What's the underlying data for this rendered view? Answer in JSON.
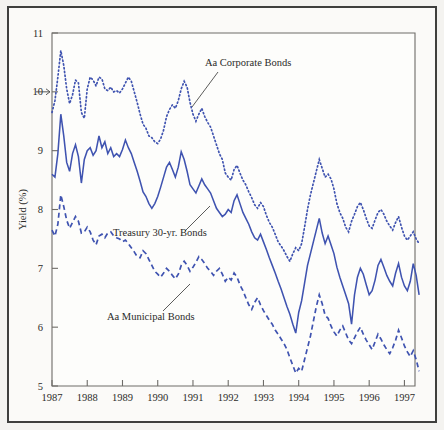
{
  "figure": {
    "background": "#f4f3f0",
    "panel_background": "#fbfaf8",
    "frame_color": "#3f3f3d",
    "series_color": "#3f53b0",
    "axis_color": "#6e6c68"
  },
  "axes": {
    "ylabel": "Yield (%)",
    "yticks": [
      "5",
      "6",
      "7",
      "8",
      "9",
      "10",
      "11"
    ],
    "xticks": [
      "1987",
      "1988",
      "1989",
      "1990",
      "1991",
      "1992",
      "1993",
      "1994",
      "1995",
      "1996",
      "1997"
    ]
  },
  "annotations": [
    {
      "id": "corporate",
      "label": "Aa Corporate Bonds"
    },
    {
      "id": "treasury",
      "label": "Treasury 30-yr. Bonds"
    },
    {
      "id": "municipal",
      "label": "Aa Municipal Bonds"
    }
  ],
  "chart_data": {
    "type": "line",
    "title": "",
    "xlabel": "",
    "ylabel": "Yield (%)",
    "xlim": [
      1987,
      1997.3
    ],
    "ylim": [
      5,
      11
    ],
    "grid": false,
    "legend": "inline-annotations",
    "xticks": [
      1987,
      1988,
      1989,
      1990,
      1991,
      1992,
      1993,
      1994,
      1995,
      1996,
      1997
    ],
    "yticks": [
      5,
      6,
      7,
      8,
      9,
      10,
      11
    ],
    "x_start": 1987.0,
    "x_step": 0.0833333,
    "series": [
      {
        "name": "Aa Corporate Bonds",
        "style": "dotted",
        "values": [
          9.65,
          9.85,
          10.25,
          10.7,
          10.45,
          10.05,
          9.8,
          9.95,
          10.2,
          10.15,
          9.65,
          9.55,
          10.05,
          10.25,
          10.2,
          10.1,
          10.25,
          10.22,
          10.05,
          10.02,
          10.08,
          10.0,
          10.02,
          9.98,
          10.05,
          10.15,
          10.25,
          10.18,
          10.0,
          9.82,
          9.62,
          9.45,
          9.38,
          9.25,
          9.22,
          9.15,
          9.12,
          9.2,
          9.35,
          9.58,
          9.7,
          9.78,
          9.72,
          9.85,
          10.05,
          10.18,
          10.08,
          9.82,
          9.62,
          9.5,
          9.62,
          9.72,
          9.58,
          9.48,
          9.4,
          9.25,
          9.1,
          8.95,
          8.85,
          8.62,
          8.55,
          8.5,
          8.68,
          8.75,
          8.62,
          8.5,
          8.42,
          8.3,
          8.2,
          8.08,
          8.02,
          8.12,
          8.05,
          7.9,
          7.78,
          7.7,
          7.58,
          7.45,
          7.38,
          7.3,
          7.2,
          7.12,
          7.25,
          7.35,
          7.3,
          7.42,
          7.7,
          8.0,
          8.25,
          8.45,
          8.65,
          8.85,
          8.7,
          8.55,
          8.6,
          8.52,
          8.35,
          8.1,
          7.95,
          7.85,
          7.7,
          7.62,
          7.8,
          7.92,
          8.05,
          8.12,
          8.0,
          7.85,
          7.72,
          7.68,
          7.82,
          7.95,
          8.0,
          7.92,
          7.8,
          7.72,
          7.65,
          7.78,
          7.88,
          7.7,
          7.55,
          7.48,
          7.55,
          7.62,
          7.5,
          7.42
        ]
      },
      {
        "name": "Treasury 30-yr. Bonds",
        "style": "solid",
        "values": [
          8.6,
          8.55,
          8.95,
          9.62,
          9.25,
          8.8,
          8.65,
          8.95,
          9.1,
          8.9,
          8.45,
          8.85,
          9.0,
          9.05,
          8.92,
          9.0,
          9.25,
          9.05,
          9.15,
          8.95,
          9.05,
          8.9,
          8.95,
          8.9,
          9.02,
          9.18,
          9.05,
          8.95,
          8.8,
          8.65,
          8.48,
          8.3,
          8.22,
          8.1,
          8.02,
          8.1,
          8.22,
          8.38,
          8.55,
          8.72,
          8.8,
          8.68,
          8.55,
          8.72,
          8.98,
          8.85,
          8.65,
          8.42,
          8.35,
          8.28,
          8.4,
          8.52,
          8.42,
          8.35,
          8.28,
          8.15,
          8.02,
          7.95,
          7.88,
          7.92,
          8.0,
          7.95,
          8.15,
          8.25,
          8.1,
          7.95,
          7.85,
          7.75,
          7.62,
          7.52,
          7.48,
          7.58,
          7.45,
          7.32,
          7.18,
          7.05,
          6.92,
          6.78,
          6.65,
          6.5,
          6.35,
          6.22,
          6.05,
          5.9,
          6.25,
          6.45,
          6.75,
          7.05,
          7.25,
          7.45,
          7.65,
          7.85,
          7.6,
          7.42,
          7.55,
          7.4,
          7.25,
          7.02,
          6.85,
          6.7,
          6.55,
          6.4,
          6.05,
          6.55,
          6.85,
          7.0,
          6.9,
          6.72,
          6.55,
          6.62,
          6.8,
          7.05,
          7.15,
          7.02,
          6.88,
          6.78,
          6.7,
          6.92,
          7.08,
          6.85,
          6.7,
          6.62,
          6.78,
          7.08,
          6.88,
          6.55
        ]
      },
      {
        "name": "Aa Municipal Bonds",
        "style": "dashed",
        "values": [
          7.65,
          7.55,
          7.75,
          8.25,
          8.05,
          7.82,
          7.68,
          7.78,
          7.88,
          7.8,
          7.6,
          7.62,
          7.7,
          7.62,
          7.48,
          7.4,
          7.55,
          7.58,
          7.52,
          7.6,
          7.62,
          7.55,
          7.52,
          7.5,
          7.45,
          7.48,
          7.42,
          7.35,
          7.28,
          7.2,
          7.18,
          7.3,
          7.25,
          7.15,
          7.05,
          6.95,
          6.9,
          6.85,
          6.92,
          7.0,
          6.95,
          6.88,
          6.82,
          6.9,
          7.05,
          7.12,
          7.05,
          6.95,
          7.02,
          7.1,
          7.2,
          7.15,
          7.08,
          7.0,
          6.95,
          6.88,
          6.95,
          7.0,
          6.9,
          6.78,
          6.85,
          6.8,
          6.92,
          6.85,
          6.72,
          6.62,
          6.5,
          6.38,
          6.3,
          6.42,
          6.5,
          6.38,
          6.28,
          6.2,
          6.12,
          6.05,
          5.95,
          5.88,
          5.8,
          5.72,
          5.62,
          5.48,
          5.35,
          5.22,
          5.3,
          5.25,
          5.45,
          5.65,
          5.85,
          6.1,
          6.35,
          6.55,
          6.4,
          6.2,
          6.15,
          6.02,
          5.92,
          5.85,
          5.95,
          6.02,
          5.9,
          5.78,
          5.72,
          5.82,
          5.92,
          6.0,
          5.88,
          5.78,
          5.7,
          5.62,
          5.75,
          5.88,
          5.8,
          5.7,
          5.62,
          5.55,
          5.65,
          5.78,
          5.95,
          5.82,
          5.68,
          5.58,
          5.5,
          5.6,
          5.45,
          5.25
        ]
      }
    ]
  }
}
